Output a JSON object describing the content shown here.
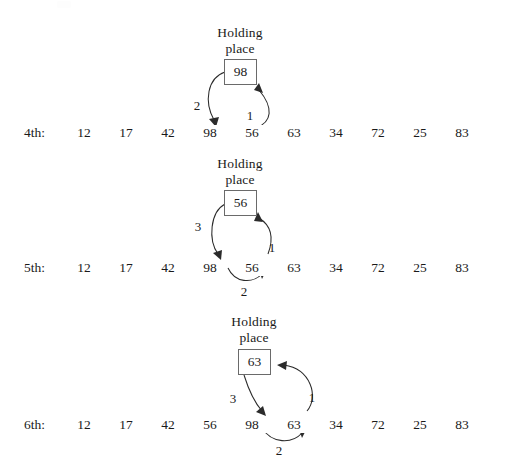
{
  "figure": {
    "background_color": "#ffffff",
    "ink_color": "#1a1a1a",
    "box_border_color": "#6a6a6a",
    "arrow_color": "#2b2b2b",
    "holding_label_line1": "Holding",
    "holding_label_line2": "place"
  },
  "panels": [
    {
      "id": "panel-4th",
      "row_label": "4th:",
      "holding_value": "98",
      "values": [
        "12",
        "17",
        "42",
        "98",
        "56",
        "63",
        "34",
        "72",
        "25",
        "83"
      ],
      "highlight_indices": [
        3,
        4
      ],
      "arrow_labels": [
        "2",
        "1"
      ],
      "arrows": [
        {
          "step": "1",
          "from": "list-position-5",
          "to": "holding-place"
        },
        {
          "step": "2",
          "from": "holding-place",
          "to": "list-position-4"
        }
      ]
    },
    {
      "id": "panel-5th",
      "row_label": "5th:",
      "holding_value": "56",
      "values": [
        "12",
        "17",
        "42",
        "98",
        "56",
        "63",
        "34",
        "72",
        "25",
        "83"
      ],
      "highlight_indices": [
        3,
        4
      ],
      "arrow_labels": [
        "3",
        "1",
        "2"
      ],
      "arrows": [
        {
          "step": "1",
          "from": "list-position-5",
          "to": "holding-place"
        },
        {
          "step": "2",
          "from": "list-position-4",
          "to": "list-position-5"
        },
        {
          "step": "3",
          "from": "holding-place",
          "to": "list-position-4"
        }
      ]
    },
    {
      "id": "panel-6th",
      "row_label": "6th:",
      "holding_value": "63",
      "values": [
        "12",
        "17",
        "42",
        "56",
        "98",
        "63",
        "34",
        "72",
        "25",
        "83"
      ],
      "highlight_indices": [
        4,
        5
      ],
      "arrow_labels": [
        "3",
        "1",
        "2"
      ],
      "arrows": [
        {
          "step": "1",
          "from": "list-position-6",
          "to": "holding-place"
        },
        {
          "step": "2",
          "from": "list-position-5",
          "to": "list-position-6"
        },
        {
          "step": "3",
          "from": "holding-place",
          "to": "list-position-5"
        }
      ]
    }
  ]
}
